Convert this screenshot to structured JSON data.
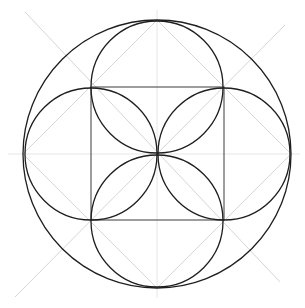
{
  "diagram": {
    "title": "",
    "colors": {
      "background": "#ffffff",
      "ink": "#1e1e1e",
      "square": "#3a3a3a",
      "guide": "#d6d6d6",
      "guide_light": "#e6e6e6"
    },
    "center": {
      "x": 157,
      "y": 154
    },
    "outer_circle": {
      "cx": 157,
      "cy": 154,
      "r": 134
    },
    "square": {
      "x": 91,
      "y": 87,
      "size": 133
    },
    "inner_circles": [
      {
        "name": "top",
        "cx": 157,
        "cy": 87,
        "r": 66
      },
      {
        "name": "bottom",
        "cx": 157,
        "cy": 221,
        "r": 66
      },
      {
        "name": "left",
        "cx": 91,
        "cy": 154,
        "r": 66
      },
      {
        "name": "right",
        "cx": 224,
        "cy": 154,
        "r": 66
      }
    ],
    "guides": {
      "diamond": "157,20 291,154 157,288 23,154",
      "diag_a": {
        "x1": 25,
        "y1": 12,
        "x2": 280,
        "y2": 282
      },
      "diag_b": {
        "x1": 15,
        "y1": 297,
        "x2": 285,
        "y2": 25
      },
      "horizontal": {
        "x1": 8,
        "y1": 154,
        "x2": 300,
        "y2": 154
      },
      "vertical": {
        "x1": 157,
        "y1": 10,
        "x2": 157,
        "y2": 298
      }
    }
  }
}
